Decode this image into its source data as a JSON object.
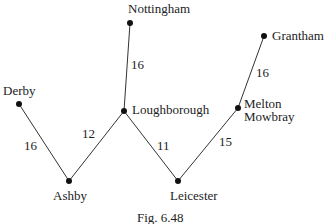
{
  "figure": {
    "caption": "Fig. 6.48",
    "nodes": [
      {
        "id": "nottingham",
        "label": "Nottingham"
      },
      {
        "id": "derby",
        "label": "Derby"
      },
      {
        "id": "loughborough",
        "label": "Loughborough"
      },
      {
        "id": "ashby",
        "label": "Ashby"
      },
      {
        "id": "leicester",
        "label": "Leicester"
      },
      {
        "id": "melton",
        "label_line1": "Melton",
        "label_line2": "Mowbray"
      },
      {
        "id": "grantham",
        "label": "Grantham"
      }
    ],
    "edges": [
      {
        "from": "Nottingham",
        "to": "Loughborough",
        "weight": "16"
      },
      {
        "from": "Derby",
        "to": "Ashby",
        "weight": "16"
      },
      {
        "from": "Ashby",
        "to": "Loughborough",
        "weight": "12"
      },
      {
        "from": "Loughborough",
        "to": "Leicester",
        "weight": "11"
      },
      {
        "from": "Leicester",
        "to": "Melton Mowbray",
        "weight": "15"
      },
      {
        "from": "Melton Mowbray",
        "to": "Grantham",
        "weight": "16"
      }
    ]
  }
}
